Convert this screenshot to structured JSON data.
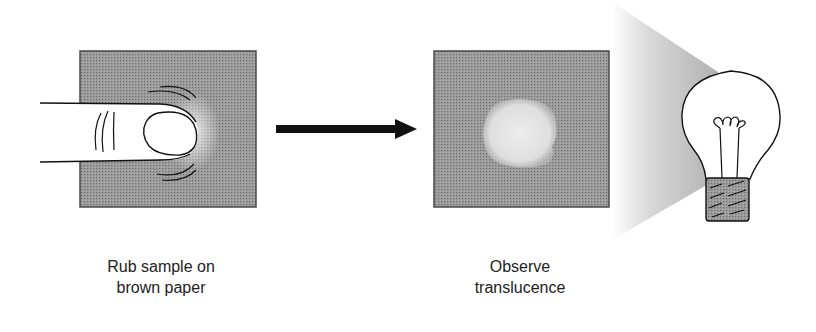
{
  "steps": [
    {
      "id": "rub",
      "label_line1": "Rub sample on",
      "label_line2": "brown paper"
    },
    {
      "id": "observe",
      "label_line1": "Observe",
      "label_line2": "translucence"
    }
  ],
  "icons": {
    "step1": "finger-rubbing-paper-icon",
    "arrow": "right-arrow-icon",
    "step2": "translucent-spot-paper-icon",
    "light": "light-bulb-icon"
  },
  "colors": {
    "paper": "#8e8e8e",
    "paper_border": "#4a4a4a",
    "spot": "#e2e2e2",
    "light_cone": "#c8c8c8",
    "ink": "#111111",
    "bulb_base": "#9a9a9a"
  }
}
